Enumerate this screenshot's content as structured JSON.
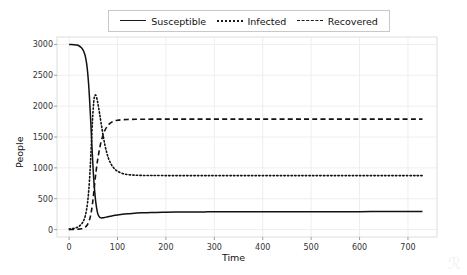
{
  "chart_data": {
    "type": "line",
    "title": "",
    "xlabel": "Time",
    "ylabel": "People",
    "xlim": [
      -25,
      760
    ],
    "ylim": [
      -120,
      3120
    ],
    "xticks": [
      0,
      100,
      200,
      300,
      400,
      500,
      600,
      700
    ],
    "yticks": [
      0,
      500,
      1000,
      1500,
      2000,
      2500,
      3000
    ],
    "grid": true,
    "legend_position": "upper center",
    "x": [
      0,
      5,
      10,
      15,
      20,
      25,
      28,
      30,
      32,
      34,
      36,
      38,
      40,
      42,
      44,
      46,
      48,
      50,
      52,
      55,
      58,
      60,
      63,
      66,
      70,
      74,
      78,
      82,
      86,
      90,
      95,
      100,
      110,
      120,
      130,
      140,
      150,
      160,
      170,
      180,
      200,
      220,
      240,
      260,
      280,
      300,
      340,
      380,
      420,
      460,
      500,
      550,
      600,
      650,
      700,
      730
    ],
    "series": [
      {
        "name": "Susceptible",
        "style": "solid",
        "color": "#111111",
        "values": [
          3000,
          2999,
          2996,
          2990,
          2978,
          2950,
          2920,
          2890,
          2850,
          2790,
          2700,
          2570,
          2390,
          2150,
          1860,
          1540,
          1220,
          930,
          700,
          450,
          300,
          240,
          200,
          190,
          192,
          198,
          205,
          212,
          218,
          224,
          231,
          237,
          248,
          256,
          262,
          267,
          271,
          274,
          276,
          278,
          281,
          283,
          285,
          286,
          287,
          288,
          289,
          290,
          290,
          291,
          291,
          291,
          291,
          292,
          292,
          292
        ]
      },
      {
        "name": "Infected",
        "style": "dotted",
        "color": "#111111",
        "values": [
          10,
          13,
          20,
          32,
          50,
          85,
          115,
          145,
          185,
          240,
          320,
          430,
          580,
          790,
          1060,
          1390,
          1720,
          1980,
          2140,
          2180,
          2100,
          2020,
          1880,
          1730,
          1540,
          1370,
          1240,
          1140,
          1070,
          1020,
          975,
          945,
          910,
          893,
          885,
          880,
          878,
          877,
          876,
          876,
          875,
          875,
          875,
          875,
          875,
          875,
          875,
          875,
          875,
          875,
          875,
          875,
          875,
          875,
          875,
          875
        ]
      },
      {
        "name": "Recovered",
        "style": "dashed",
        "color": "#111111",
        "values": [
          0,
          1,
          2,
          4,
          8,
          14,
          20,
          26,
          34,
          45,
          60,
          82,
          112,
          155,
          215,
          295,
          400,
          530,
          680,
          900,
          1080,
          1180,
          1310,
          1420,
          1530,
          1610,
          1665,
          1705,
          1730,
          1750,
          1765,
          1772,
          1780,
          1784,
          1786,
          1787,
          1788,
          1788,
          1789,
          1789,
          1790,
          1790,
          1790,
          1790,
          1790,
          1790,
          1790,
          1790,
          1790,
          1790,
          1790,
          1790,
          1790,
          1790,
          1790,
          1790
        ]
      }
    ]
  },
  "legend": {
    "items": [
      {
        "label": "Susceptible",
        "style": "solid"
      },
      {
        "label": "Infected",
        "style": "dotted"
      },
      {
        "label": "Recovered",
        "style": "dashed"
      }
    ]
  },
  "plot_area": {
    "left": 57,
    "top": 37,
    "right": 437,
    "bottom": 237
  },
  "colors": {
    "line": "#111111",
    "grid": "#eeeeee",
    "frame": "#dddddd",
    "background": "#ffffff",
    "tick_text": "#333333"
  }
}
